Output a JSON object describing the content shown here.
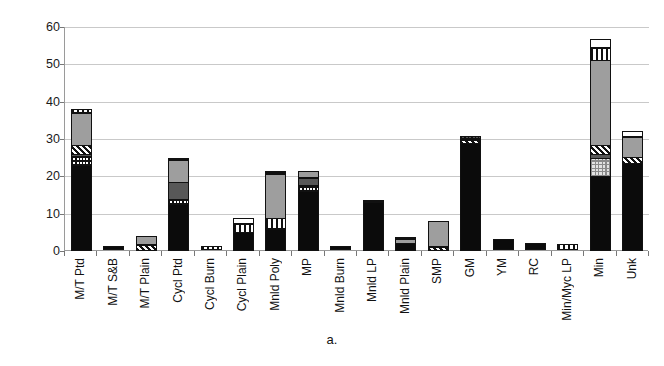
{
  "caption": "a.",
  "chart_data": {
    "type": "bar",
    "title": "",
    "subtitle": "",
    "xlabel": "",
    "ylabel": "",
    "ylim": [
      0,
      60
    ],
    "yticks": [
      0,
      10,
      20,
      30,
      40,
      50,
      60
    ],
    "ytick_labels": [
      "0",
      "10",
      "20",
      "30",
      "40",
      "50",
      "60"
    ],
    "grid": true,
    "stacked": true,
    "legend": "none",
    "categories": [
      "M/T Ptd",
      "M/T S&B",
      "M/T Plain",
      "Cycl Ptd",
      "Cycl Burn",
      "Cycl Plain",
      "Mnld Poly",
      "MP",
      "Mnld Burn",
      "Mnld LP",
      "Mnld Plain",
      "SMP",
      "GM",
      "YM",
      "RC",
      "Min/Myc LP",
      "Min",
      "Unk"
    ],
    "totals": [
      39,
      1,
      4,
      26,
      1,
      9,
      22,
      22,
      1,
      13.5,
      4,
      8,
      31,
      3,
      2,
      1.5,
      58,
      32.5
    ],
    "series": [
      {
        "name": "solid-black",
        "fill": "f-black",
        "values": [
          23,
          1,
          0,
          12.5,
          0,
          5,
          6,
          16,
          1,
          13,
          2,
          0,
          29,
          3,
          2,
          0,
          20,
          23.5
        ]
      },
      {
        "name": "fine-dot",
        "fill": "f-dot",
        "values": [
          2.5,
          0,
          0,
          1.5,
          0,
          0,
          0,
          2,
          0,
          0,
          0,
          0,
          0,
          0,
          0,
          0,
          0,
          0
        ]
      },
      {
        "name": "light-dot",
        "fill": "f-lightdot",
        "values": [
          0,
          0,
          0,
          0,
          0,
          0,
          0,
          0,
          0,
          0,
          0,
          0,
          0,
          0,
          0,
          0,
          5,
          0
        ]
      },
      {
        "name": "vert-line",
        "fill": "f-vline",
        "values": [
          0,
          0,
          0,
          0,
          1,
          2.5,
          3,
          0,
          0,
          0,
          0,
          0,
          0,
          0,
          0,
          1.5,
          0,
          0
        ]
      },
      {
        "name": "dark-gray",
        "fill": "f-dgray",
        "values": [
          1,
          0,
          0,
          5,
          0,
          0,
          0,
          2,
          0,
          0,
          0,
          0,
          0,
          0,
          0,
          0,
          1.5,
          0
        ]
      },
      {
        "name": "diag-hatch",
        "fill": "f-hatch",
        "values": [
          2.5,
          0,
          1.5,
          0,
          0,
          0,
          0,
          0,
          0,
          0,
          0,
          1,
          1,
          0,
          0,
          0,
          2.5,
          2
        ]
      },
      {
        "name": "mid-gray",
        "fill": "f-mgray",
        "values": [
          9,
          0,
          2.5,
          6,
          0,
          0,
          12,
          2,
          0,
          0,
          1.3,
          7,
          0,
          0,
          0,
          0,
          23,
          5.5
        ]
      },
      {
        "name": "dark-checker",
        "fill": "f-darkdot",
        "values": [
          0,
          0,
          0,
          0.5,
          0,
          0,
          1,
          0,
          0,
          0.5,
          0,
          0,
          1,
          0,
          0,
          0,
          0,
          0
        ]
      },
      {
        "name": "top-vline",
        "fill": "f-vline",
        "values": [
          1,
          0,
          0,
          0,
          0,
          0,
          0,
          0,
          0,
          0,
          0,
          0,
          0,
          0,
          0,
          0,
          3.5,
          0
        ]
      },
      {
        "name": "white-cap",
        "fill": "f-white",
        "values": [
          0,
          0,
          0,
          0,
          0,
          1.5,
          0,
          0,
          0,
          0,
          0.7,
          0,
          0,
          0,
          0,
          0,
          2.5,
          1.5
        ]
      }
    ]
  }
}
